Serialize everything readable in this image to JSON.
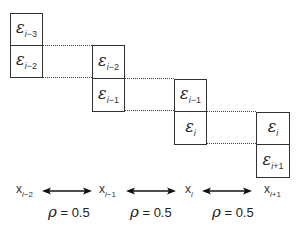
{
  "diagram": {
    "columns": [
      {
        "top": {
          "symbol": "ε",
          "index": "i",
          "offset": "−3"
        },
        "bottom": {
          "symbol": "ε",
          "index": "i",
          "offset": "−2"
        }
      },
      {
        "top": {
          "symbol": "ε",
          "index": "i",
          "offset": "−2"
        },
        "bottom": {
          "symbol": "ε",
          "index": "i",
          "offset": "−1"
        }
      },
      {
        "top": {
          "symbol": "ε",
          "index": "i",
          "offset": "−1"
        },
        "bottom": {
          "symbol": "ε",
          "index": "i",
          "offset": ""
        }
      },
      {
        "top": {
          "symbol": "ε",
          "index": "i",
          "offset": ""
        },
        "bottom": {
          "symbol": "ε",
          "index": "i",
          "offset": "+1"
        }
      }
    ],
    "x_labels": [
      {
        "symbol": "x",
        "index": "i",
        "offset": "−2"
      },
      {
        "symbol": "x",
        "index": "i",
        "offset": "−1"
      },
      {
        "symbol": "x",
        "index": "i",
        "offset": ""
      },
      {
        "symbol": "x",
        "index": "i",
        "offset": "+1"
      }
    ],
    "correlations": [
      {
        "symbol": "ρ",
        "text": " = 0.5"
      },
      {
        "symbol": "ρ",
        "text": " = 0.5"
      },
      {
        "symbol": "ρ",
        "text": " = 0.5"
      }
    ],
    "colors": {
      "line": "#333333",
      "background": "#ffffff"
    }
  }
}
